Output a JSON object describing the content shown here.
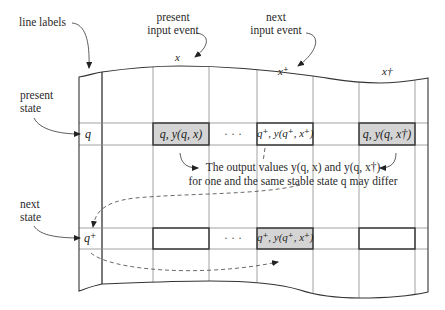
{
  "diagram": {
    "type": "state-transition-table-illustration",
    "annotations": {
      "line_labels": "line labels",
      "present_input_event": [
        "present",
        "input event"
      ],
      "next_input_event": [
        "next",
        "input event"
      ],
      "present_state": [
        "present",
        "state"
      ],
      "next_state": [
        "next",
        "state"
      ]
    },
    "column_labels": [
      {
        "id": "x",
        "text": "x"
      },
      {
        "id": "x_plus",
        "text": "x⁺"
      },
      {
        "id": "x_dagger",
        "text": "x†"
      }
    ],
    "row_labels": {
      "present": "q",
      "next": "q⁺"
    },
    "cells": {
      "present_row": [
        {
          "text": "q, y(q, x)",
          "shaded": true
        },
        {
          "text": "· · ·",
          "shaded": false,
          "ellipsis": true
        },
        {
          "text": "q⁺, y(q⁺, x⁺)",
          "shaded": false
        },
        {
          "text": "q, y(q, x†)",
          "shaded": true
        }
      ],
      "next_row": [
        {
          "text": "",
          "shaded": false
        },
        {
          "text": "· · ·",
          "shaded": false,
          "ellipsis": true
        },
        {
          "text": "q⁺, y(q⁺, x⁺)",
          "shaded": true
        },
        {
          "text": "",
          "shaded": false
        }
      ]
    },
    "note": {
      "line1": "The output values y(q, x) and y(q, x†)",
      "line2": "for one and the same stable state q may differ"
    },
    "colors": {
      "shade": "#d4d4d4",
      "line": "#3a3a3a",
      "grid": "#8a8a8a"
    }
  }
}
